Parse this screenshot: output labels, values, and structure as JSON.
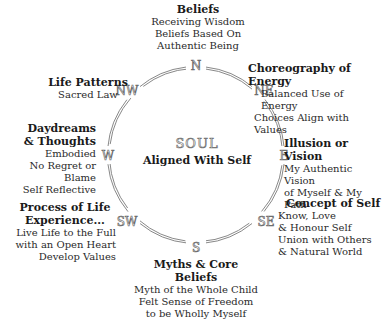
{
  "center": {
    "title": "SOUL",
    "subtitle": "Aligned With Self"
  },
  "directions": [
    "N",
    "NE",
    "E",
    "SE",
    "S",
    "SW",
    "W",
    "NW"
  ],
  "sections": {
    "n": {
      "title": "Beliefs",
      "lines": [
        "Receiving Wisdom",
        "Beliefs Based On",
        "Authentic Being"
      ]
    },
    "ne": {
      "title": "Choreography of Energy",
      "lines": [
        "Balanced Use of Energy",
        "Choices Align with Values"
      ]
    },
    "e": {
      "title": "Illusion or Vision",
      "lines": [
        "My Authentic Vision",
        "of Myself & My Path"
      ]
    },
    "se": {
      "title": "Concept of Self",
      "lines": [
        "Know, Love",
        "& Honour Self",
        "Union with Others",
        "& Natural World"
      ]
    },
    "s": {
      "title1": "Myths & Core",
      "title2": "Beliefs",
      "lines": [
        "Myth of the Whole Child",
        "Felt Sense of Freedom",
        "to be Wholly Myself"
      ]
    },
    "sw": {
      "title1": "Process of Life",
      "title2": "Experience...",
      "lines": [
        "Live Life to the Full",
        "with an Open Heart",
        "Develop Values"
      ]
    },
    "w": {
      "title1": "Daydreams",
      "title2": "& Thoughts",
      "lines": [
        "Embodied",
        "No Regret or Blame",
        "Self Reflective"
      ]
    },
    "nw": {
      "title": "Life Patterns",
      "lines": [
        "Sacred Law"
      ]
    }
  },
  "colors": {
    "ring": "#7a7a7a",
    "text": "#1a1a1a"
  }
}
